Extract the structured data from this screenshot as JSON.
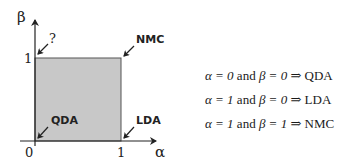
{
  "diagram": {
    "axes": {
      "x_label": "α",
      "y_label": "β",
      "x_ticks": [
        "0",
        "1"
      ],
      "y_ticks": [
        "1"
      ]
    },
    "region": {
      "fill": "#c8c8c8",
      "stroke": "#555555"
    },
    "corner_labels": {
      "top_left": "?",
      "top_right": "NMC",
      "bottom_left": "QDA",
      "bottom_right": "LDA"
    }
  },
  "equations": [
    {
      "alpha": "α = 0",
      "and": "and",
      "beta": "β = 0",
      "arrow": "⇒",
      "result": "QDA"
    },
    {
      "alpha": "α = 1",
      "and": "and",
      "beta": "β = 0",
      "arrow": "⇒",
      "result": "LDA"
    },
    {
      "alpha": "α = 1",
      "and": "and",
      "beta": "β = 1",
      "arrow": "⇒",
      "result": "NMC"
    }
  ]
}
